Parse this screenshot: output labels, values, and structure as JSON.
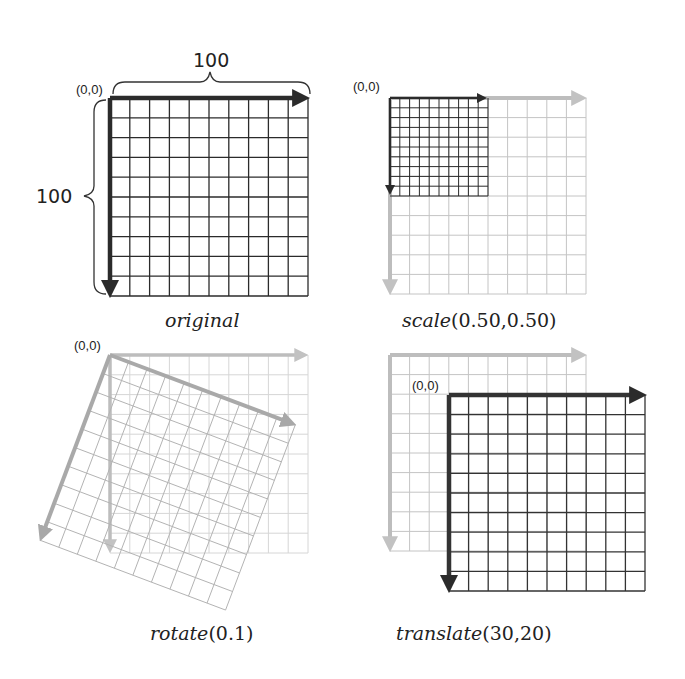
{
  "figure": {
    "panels": [
      {
        "id": "original",
        "caption_fn": "original",
        "caption_args": "",
        "origin_label": "(0,0)",
        "width_label": "100",
        "height_label": "100"
      },
      {
        "id": "scale",
        "caption_fn": "scale",
        "caption_args": "(0.50,0.50)",
        "origin_label": "(0,0)"
      },
      {
        "id": "rotate",
        "caption_fn": "rotate",
        "caption_args": "(0.1)",
        "origin_label": "(0,0)"
      },
      {
        "id": "translate",
        "caption_fn": "translate",
        "caption_args": "(30,20)",
        "origin_label": "(0,0)"
      }
    ],
    "colors": {
      "dark": "#2b2b2b",
      "ghost": "#c4c4c4",
      "ghost_axis": "#bdbdbd",
      "rotate_axis": "#a9a9a9"
    }
  }
}
